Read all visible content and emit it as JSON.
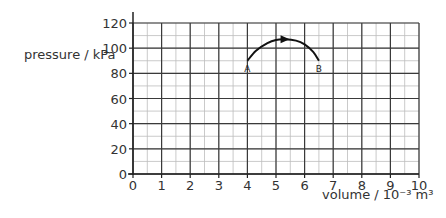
{
  "chart_data": {
    "type": "line",
    "title": "",
    "xlabel": "volume / 10⁻³ m³",
    "ylabel": "pressure / kPa",
    "xlim": [
      0,
      10
    ],
    "ylim": [
      0,
      120
    ],
    "x_ticks": [
      "0",
      "1",
      "2",
      "3",
      "4",
      "5",
      "6",
      "7",
      "8",
      "9",
      "10"
    ],
    "y_ticks": [
      "0",
      "20",
      "40",
      "60",
      "80",
      "100",
      "120"
    ],
    "grid": true,
    "minor_grid": true,
    "legend": null,
    "series": [
      {
        "name": "A to B",
        "x": [
          4.0,
          4.3,
          4.7,
          5.0,
          5.3,
          5.7,
          6.0,
          6.3,
          6.5
        ],
        "y": [
          90,
          98,
          104,
          106.5,
          107,
          106,
          103,
          97,
          90
        ],
        "direction_arrow_at": {
          "x": 5.3,
          "y": 107
        },
        "arrow_direction": "right"
      }
    ],
    "annotations": [
      {
        "text": "A",
        "x": 4.0,
        "y": 90
      },
      {
        "text": "B",
        "x": 6.5,
        "y": 90
      }
    ]
  },
  "labels": {
    "ylabel": "pressure / kPa",
    "xlabel": "volume / 10⁻³ m³"
  }
}
